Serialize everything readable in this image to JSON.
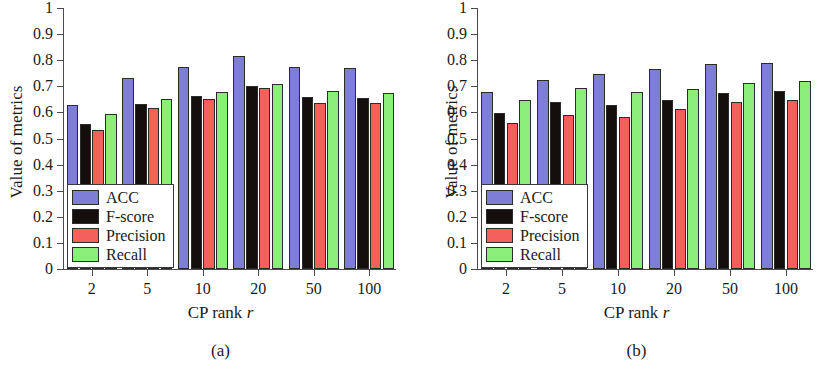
{
  "figure": {
    "panels": [
      {
        "id": "a",
        "caption": "(a)",
        "xlabel_prefix": "CP rank ",
        "xlabel_italic": "r",
        "ylabel": "Value of metrics"
      },
      {
        "id": "b",
        "caption": "(b)",
        "xlabel_prefix": "CP rank ",
        "xlabel_italic": "r",
        "ylabel": "Value of metrics"
      }
    ]
  },
  "colors": {
    "acc": "#7E7ED6",
    "fscore": "#140f0c",
    "precision": "#F4605A",
    "recall": "#8BEE7A",
    "axis": "#4a4a4a",
    "bar_edge": "#2b2b2b",
    "background": "#ffffff"
  },
  "legend": {
    "position": "lower-left-inside",
    "entries": [
      {
        "label": "ACC",
        "color_key": "acc"
      },
      {
        "label": "F-score",
        "color_key": "fscore"
      },
      {
        "label": "Precision",
        "color_key": "precision"
      },
      {
        "label": "Recall",
        "color_key": "recall"
      }
    ]
  },
  "yticks": [
    "0",
    "0.1",
    "0.2",
    "0.3",
    "0.4",
    "0.5",
    "0.6",
    "0.7",
    "0.8",
    "0.9",
    "1"
  ],
  "ytick_values": [
    0,
    0.1,
    0.2,
    0.3,
    0.4,
    0.5,
    0.6,
    0.7,
    0.8,
    0.9,
    1
  ],
  "chart_data": [
    {
      "type": "bar",
      "panel": "a",
      "title": "(a)",
      "xlabel": "CP rank r",
      "ylabel": "Value of metrics",
      "categories": [
        "2",
        "5",
        "10",
        "20",
        "50",
        "100"
      ],
      "series": [
        {
          "name": "ACC",
          "values": [
            0.63,
            0.733,
            0.774,
            0.816,
            0.774,
            0.772
          ]
        },
        {
          "name": "F-score",
          "values": [
            0.557,
            0.634,
            0.662,
            0.702,
            0.659,
            0.655
          ]
        },
        {
          "name": "Precision",
          "values": [
            0.531,
            0.618,
            0.65,
            0.692,
            0.637,
            0.636
          ]
        },
        {
          "name": "Recall",
          "values": [
            0.595,
            0.653,
            0.677,
            0.707,
            0.683,
            0.673
          ]
        }
      ],
      "ylim": [
        0,
        1
      ],
      "ytick_step": 0.1,
      "grid": false,
      "legend": "inside lower-left"
    },
    {
      "type": "bar",
      "panel": "b",
      "title": "(b)",
      "xlabel": "CP rank r",
      "ylabel": "Value of metrics",
      "categories": [
        "2",
        "5",
        "10",
        "20",
        "50",
        "100"
      ],
      "series": [
        {
          "name": "ACC",
          "values": [
            0.679,
            0.726,
            0.747,
            0.766,
            0.784,
            0.789
          ]
        },
        {
          "name": "F-score",
          "values": [
            0.597,
            0.64,
            0.627,
            0.648,
            0.675,
            0.681
          ]
        },
        {
          "name": "Precision",
          "values": [
            0.558,
            0.592,
            0.581,
            0.612,
            0.641,
            0.647
          ]
        },
        {
          "name": "Recall",
          "values": [
            0.648,
            0.694,
            0.68,
            0.689,
            0.712,
            0.719
          ]
        }
      ],
      "ylim": [
        0,
        1
      ],
      "ytick_step": 0.1,
      "grid": false,
      "legend": "inside lower-left"
    }
  ]
}
